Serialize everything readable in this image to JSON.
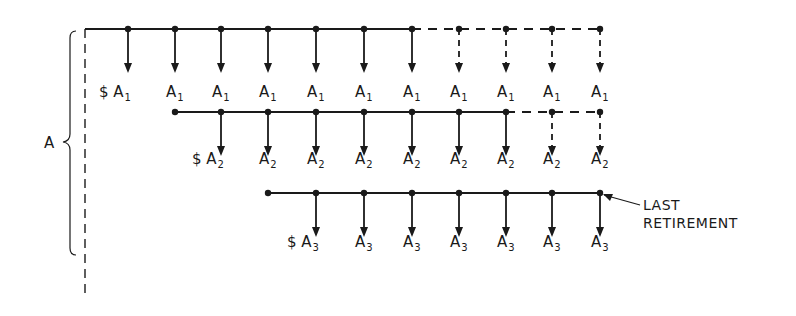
{
  "diagram": {
    "group_label": "A",
    "currency_symbol": "$",
    "note": {
      "line1": "LAST",
      "line2": "RETIREMENT"
    },
    "rows": [
      {
        "id": "row1",
        "label": "A",
        "subscript": "1",
        "y": 29,
        "label_y": 97,
        "start_x": 85,
        "start_dot": false,
        "solid_until_x": 412,
        "points": [
          128,
          175,
          221,
          268,
          316,
          364,
          412,
          459,
          506,
          552,
          600
        ],
        "dashed_arrows_from_index": 7
      },
      {
        "id": "row2",
        "label": "A",
        "subscript": "2",
        "y": 112,
        "label_y": 164,
        "start_x": 175,
        "start_dot": true,
        "solid_until_x": 506,
        "points": [
          221,
          268,
          316,
          364,
          412,
          459,
          506,
          552,
          600
        ],
        "dashed_arrows_from_index": 7
      },
      {
        "id": "row3",
        "label": "A",
        "subscript": "3",
        "y": 193,
        "label_y": 247,
        "start_x": 268,
        "start_dot": true,
        "solid_until_x": 600,
        "points": [
          316,
          364,
          412,
          459,
          506,
          552,
          600
        ],
        "dashed_arrows_from_index": 99
      }
    ]
  }
}
